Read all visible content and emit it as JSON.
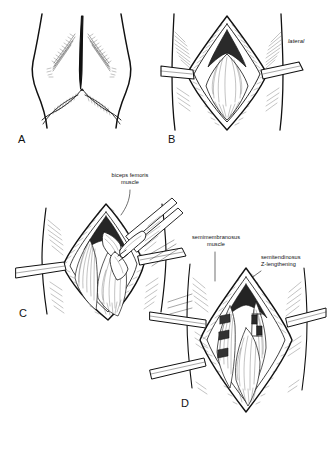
{
  "figure": {
    "background_color": "#ffffff",
    "ink_color": "#111111",
    "width": 329,
    "height": 452
  },
  "panels": [
    {
      "id": "A",
      "letter": "A",
      "letter_pos": {
        "x": 18,
        "y": 134
      },
      "caption": "",
      "description": "Posterior view of the distal thigh and popliteal fossa with planned midline longitudinal skin incision",
      "labels": []
    },
    {
      "id": "B",
      "letter": "B",
      "letter_pos": {
        "x": 169,
        "y": 134
      },
      "caption": "",
      "description": "Skin and fascia incised, wound held open with retractors exposing the popliteal fat and fascia",
      "labels": [
        {
          "text": "lateral",
          "style": "italic",
          "align": "left",
          "pos": {
            "x": 288,
            "y": 41
          },
          "leader": null
        }
      ]
    },
    {
      "id": "C",
      "letter": "C",
      "letter_pos": {
        "x": 19,
        "y": 311
      },
      "caption": "",
      "description": "Biceps femoris muscle isolated and held with a clamp, retractors widening the exposure",
      "labels": [
        {
          "text": "biceps femoris\nmuscle",
          "style": "plain",
          "align": "center",
          "pos": {
            "x": 100,
            "y": 174
          },
          "leader": {
            "x1": 127,
            "y1": 191,
            "x2": 120,
            "y2": 214
          }
        }
      ]
    },
    {
      "id": "D",
      "letter": "D",
      "letter_pos": {
        "x": 181,
        "y": 398
      },
      "caption": "",
      "description": "Semimembranosus muscle retracted and semitendinosus tendon divided for Z-lengthening",
      "labels": [
        {
          "text": "semimembranosus\nmuscle",
          "style": "plain",
          "align": "center",
          "pos": {
            "x": 184,
            "y": 237
          },
          "leader": {
            "x1": 215,
            "y1": 252,
            "x2": 215,
            "y2": 279
          }
        },
        {
          "text": "semitendinosus\nZ-lengthening",
          "style": "plain",
          "align": "left",
          "pos": {
            "x": 261,
            "y": 257
          },
          "leader": {
            "x1": 262,
            "y1": 272,
            "x2": 244,
            "y2": 283
          }
        }
      ]
    }
  ],
  "anatomy_terms": [
    "lateral",
    "biceps femoris muscle",
    "semimembranosus muscle",
    "semitendinosus Z-lengthening"
  ]
}
